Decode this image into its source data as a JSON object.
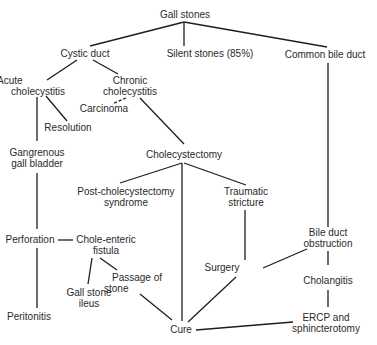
{
  "diagram": {
    "title": "Gall stones",
    "nodes": [
      {
        "id": "gall_stones",
        "lines": [
          "Gall stones"
        ]
      },
      {
        "id": "cystic_duct",
        "lines": [
          "Cystic duct"
        ]
      },
      {
        "id": "silent_stones",
        "lines": [
          "Silent stones (85%)"
        ]
      },
      {
        "id": "common_bile_duct",
        "lines": [
          "Common bile duct"
        ]
      },
      {
        "id": "acute_cholecystitis",
        "lines": [
          "Acute",
          "cholecystitis"
        ]
      },
      {
        "id": "chronic_cholecystitis",
        "lines": [
          "Chronic",
          "cholecystitis"
        ]
      },
      {
        "id": "carcinoma",
        "lines": [
          "Carcinoma"
        ]
      },
      {
        "id": "resolution",
        "lines": [
          "Resolution"
        ]
      },
      {
        "id": "gangrenous_gall_bladder",
        "lines": [
          "Gangrenous",
          "gall bladder"
        ]
      },
      {
        "id": "cholecystectomy",
        "lines": [
          "Cholecystectomy"
        ]
      },
      {
        "id": "post_cholecystectomy_syndrome",
        "lines": [
          "Post-cholecystectomy",
          "syndrome"
        ]
      },
      {
        "id": "traumatic_stricture",
        "lines": [
          "Traumatic",
          "stricture"
        ]
      },
      {
        "id": "perforation",
        "lines": [
          "Perforation"
        ]
      },
      {
        "id": "chole_enteric_fistula",
        "lines": [
          "Chole-enteric",
          "fistula"
        ]
      },
      {
        "id": "bile_duct_obstruction",
        "lines": [
          "Bile duct",
          "obstruction"
        ]
      },
      {
        "id": "passage_of_stone",
        "lines": [
          "Passage of",
          "stone"
        ]
      },
      {
        "id": "gall_stone_ileus",
        "lines": [
          "Gall stone",
          "ileus"
        ]
      },
      {
        "id": "surgery",
        "lines": [
          "Surgery"
        ]
      },
      {
        "id": "cholangitis",
        "lines": [
          "Cholangitis"
        ]
      },
      {
        "id": "peritonitis",
        "lines": [
          "Peritonitis"
        ]
      },
      {
        "id": "cure",
        "lines": [
          "Cure"
        ]
      },
      {
        "id": "ercp_sphincterotomy",
        "lines": [
          "ERCP and",
          "sphincterotomy"
        ]
      }
    ],
    "edges": [
      {
        "from": "gall_stones",
        "to": "cystic_duct",
        "style": "solid"
      },
      {
        "from": "gall_stones",
        "to": "silent_stones",
        "style": "solid"
      },
      {
        "from": "gall_stones",
        "to": "common_bile_duct",
        "style": "solid"
      },
      {
        "from": "cystic_duct",
        "to": "acute_cholecystitis",
        "style": "solid"
      },
      {
        "from": "cystic_duct",
        "to": "chronic_cholecystitis",
        "style": "solid"
      },
      {
        "from": "chronic_cholecystitis",
        "to": "carcinoma",
        "style": "dashed"
      },
      {
        "from": "chronic_cholecystitis",
        "to": "cholecystectomy",
        "style": "solid"
      },
      {
        "from": "acute_cholecystitis",
        "to": "resolution",
        "style": "solid"
      },
      {
        "from": "acute_cholecystitis",
        "to": "gangrenous_gall_bladder",
        "style": "solid"
      },
      {
        "from": "gangrenous_gall_bladder",
        "to": "perforation",
        "style": "solid"
      },
      {
        "from": "perforation",
        "to": "chole_enteric_fistula",
        "style": "solid"
      },
      {
        "from": "perforation",
        "to": "peritonitis",
        "style": "solid"
      },
      {
        "from": "chole_enteric_fistula",
        "to": "gall_stone_ileus",
        "style": "solid"
      },
      {
        "from": "chole_enteric_fistula",
        "to": "passage_of_stone",
        "style": "solid"
      },
      {
        "from": "passage_of_stone",
        "to": "cure",
        "style": "solid"
      },
      {
        "from": "cholecystectomy",
        "to": "post_cholecystectomy_syndrome",
        "style": "solid"
      },
      {
        "from": "cholecystectomy",
        "to": "traumatic_stricture",
        "style": "solid"
      },
      {
        "from": "cholecystectomy",
        "to": "cure",
        "style": "solid"
      },
      {
        "from": "traumatic_stricture",
        "to": "surgery",
        "style": "solid"
      },
      {
        "from": "common_bile_duct",
        "to": "bile_duct_obstruction",
        "style": "solid"
      },
      {
        "from": "bile_duct_obstruction",
        "to": "surgery",
        "style": "solid"
      },
      {
        "from": "bile_duct_obstruction",
        "to": "cholangitis",
        "style": "solid"
      },
      {
        "from": "cholangitis",
        "to": "ercp_sphincterotomy",
        "style": "solid"
      },
      {
        "from": "surgery",
        "to": "cure",
        "style": "solid"
      },
      {
        "from": "ercp_sphincterotomy",
        "to": "cure",
        "style": "solid"
      }
    ]
  }
}
